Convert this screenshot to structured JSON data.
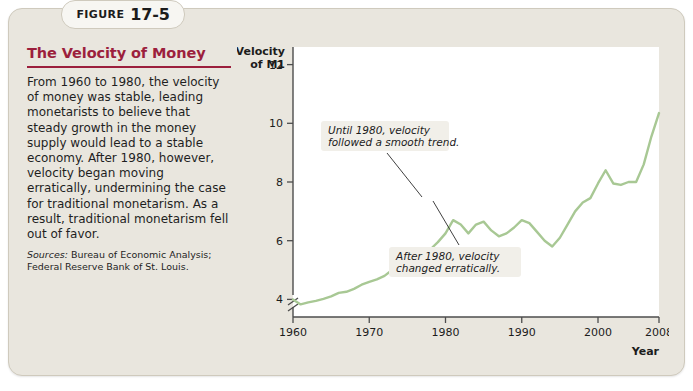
{
  "figure": {
    "kicker": "FIGURE",
    "number": "17-5",
    "title": "The Velocity of Money",
    "caption": "From 1960 to 1980, the velocity of money was stable, leading monetarists to believe that steady growth in the money supply would lead to a stable economy. After 1980, however, velocity began moving erratically, undermining the case for traditional monetarism. As a result, traditional monetarism fell out of favor.",
    "sources_label": "Sources:",
    "sources_text": "Bureau of Economic Analysis; Federal Reserve Bank of St. Louis."
  },
  "colors": {
    "accent": "#9c1f3d",
    "line": "#a8c894",
    "panel_bg": "#e9e6de",
    "panel_border": "#cfcabd",
    "plot_bg": "#ffffff",
    "axis": "#4d4d4d",
    "text": "#1c1c1c",
    "annotation_bg": "#f1efe9"
  },
  "chart_data": {
    "type": "line",
    "title": "The Velocity of Money",
    "xlabel": "Year",
    "ylabel": "Velocity of M1",
    "ylabel_line1": "Velocity",
    "ylabel_line2": "of M1",
    "xlim": [
      1960,
      2008
    ],
    "ylim": [
      3.4,
      12.6
    ],
    "y_axis_break": true,
    "grid": false,
    "legend": "none",
    "xticks": [
      1960,
      1970,
      1980,
      1990,
      2000,
      2008
    ],
    "xtick_labels": [
      "1960",
      "1970",
      "1980",
      "1990",
      "2000",
      "2008"
    ],
    "yticks": [
      4,
      6,
      8,
      10,
      12
    ],
    "ytick_labels": [
      "4",
      "6",
      "8",
      "10",
      "12"
    ],
    "series": [
      {
        "name": "Velocity of M1",
        "x": [
          1960,
          1961,
          1962,
          1963,
          1964,
          1965,
          1966,
          1967,
          1968,
          1969,
          1970,
          1971,
          1972,
          1973,
          1974,
          1975,
          1976,
          1977,
          1978,
          1979,
          1980,
          1981,
          1982,
          1983,
          1984,
          1985,
          1986,
          1987,
          1988,
          1989,
          1990,
          1991,
          1992,
          1993,
          1994,
          1995,
          1996,
          1997,
          1998,
          1999,
          2000,
          2001,
          2002,
          2003,
          2004,
          2005,
          2006,
          2007,
          2008
        ],
        "values": [
          4.0,
          3.83,
          3.9,
          3.95,
          4.02,
          4.1,
          4.22,
          4.26,
          4.36,
          4.5,
          4.6,
          4.68,
          4.8,
          5.0,
          5.12,
          5.18,
          5.3,
          5.45,
          5.7,
          5.95,
          6.25,
          6.7,
          6.55,
          6.25,
          6.55,
          6.65,
          6.35,
          6.15,
          6.25,
          6.45,
          6.7,
          6.6,
          6.3,
          6.0,
          5.8,
          6.1,
          6.55,
          7.0,
          7.3,
          7.45,
          7.95,
          8.4,
          7.95,
          7.9,
          8.0,
          8.0,
          8.6,
          9.55,
          10.35
        ]
      }
    ],
    "annotations": [
      {
        "id": "annotation-smooth-trend",
        "line1": "Until 1980, velocity",
        "line2": "followed a smooth trend.",
        "points_to_year": 1979
      },
      {
        "id": "annotation-erratic",
        "line1": "After 1980, velocity",
        "line2": "changed erratically.",
        "points_to_year": 1983
      }
    ]
  }
}
